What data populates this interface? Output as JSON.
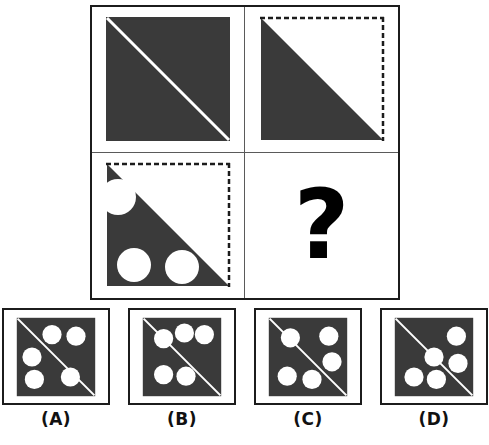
{
  "puzzle": {
    "type": "visual-analogy-matrix",
    "title": "",
    "missing_cell_symbol": "?",
    "colors": {
      "fill_dark": "#3a3a3a",
      "line_white": "#ffffff",
      "border_black": "#1c1c1c",
      "divider_gray": "#5a5a5a",
      "background": "#ffffff"
    },
    "matrix": {
      "rows": 2,
      "cols": 2,
      "cells": [
        {
          "position": "row1-col1",
          "name": "cell-1",
          "description": "Solid dark square with a white diagonal line from top-left to bottom-right",
          "shape": "full-square",
          "border_style": "solid",
          "diagonal": "tl-br",
          "circles": 0
        },
        {
          "position": "row1-col2",
          "name": "cell-2",
          "description": "Lower-left dark triangle; dashed outline on top and right edges",
          "shape": "lower-left-triangle",
          "border_style": "dashed",
          "diagonal": "tl-br",
          "circles": 0
        },
        {
          "position": "row2-col1",
          "name": "cell-3",
          "description": "Lower-left dark triangle with three white circular holes: one bitten out at the upper-left edge, two along the bottom",
          "shape": "lower-left-triangle",
          "border_style": "dashed",
          "diagonal": "tl-br",
          "circles": 3
        },
        {
          "position": "row2-col2",
          "name": "cell-4-missing",
          "description": "Missing cell marked with a bold question mark",
          "shape": "question-mark",
          "border_style": "none",
          "diagonal": "none",
          "circles": 0
        }
      ]
    },
    "options": [
      {
        "key": "A",
        "label": "(A)",
        "description": "Dark square, white diagonal top-left to bottom-right, five white circles",
        "circles": 5,
        "diagonal": "tl-br",
        "circle_positions": [
          [
            0.45,
            0.22
          ],
          [
            0.75,
            0.24
          ],
          [
            0.2,
            0.5
          ],
          [
            0.23,
            0.78
          ],
          [
            0.68,
            0.75
          ]
        ]
      },
      {
        "key": "B",
        "label": "(B)",
        "description": "Dark square, white diagonal top-left to bottom-right, five white circles: three across the top, two at lower left",
        "circles": 5,
        "diagonal": "tl-br",
        "circle_positions": [
          [
            0.27,
            0.27
          ],
          [
            0.53,
            0.2
          ],
          [
            0.78,
            0.22
          ],
          [
            0.27,
            0.72
          ],
          [
            0.55,
            0.74
          ]
        ]
      },
      {
        "key": "C",
        "label": "(C)",
        "description": "Dark square, white diagonal top-left to bottom-right, five white circles",
        "circles": 5,
        "diagonal": "tl-br",
        "circle_positions": [
          [
            0.28,
            0.26
          ],
          [
            0.76,
            0.24
          ],
          [
            0.8,
            0.56
          ],
          [
            0.24,
            0.74
          ],
          [
            0.55,
            0.78
          ]
        ]
      },
      {
        "key": "D",
        "label": "(D)",
        "description": "Dark square, white diagonal top-left to bottom-right, five white circles arranged around the diagonal",
        "circles": 5,
        "diagonal": "tl-br",
        "circle_positions": [
          [
            0.78,
            0.24
          ],
          [
            0.5,
            0.5
          ],
          [
            0.8,
            0.58
          ],
          [
            0.25,
            0.75
          ],
          [
            0.53,
            0.78
          ]
        ]
      }
    ]
  }
}
